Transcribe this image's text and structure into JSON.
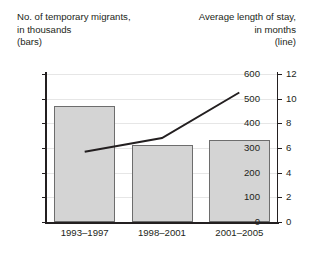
{
  "captions": {
    "left": "No. of temporary migrants,\nin thousands\n(bars)",
    "right": "Average length of stay,\nin months\n(line)"
  },
  "colors": {
    "bar_fill": "#d4d4d4",
    "bar_stroke": "#6d6d6d",
    "line": "#231f20",
    "axis": "#231f20",
    "grid": "#e6e6e6",
    "background": "#ffffff"
  },
  "chart_data": {
    "type": "bar",
    "title": "",
    "subtitle": "",
    "xlabel": "",
    "categories": [
      "1993–1997",
      "1998–2001",
      "2001–2005"
    ],
    "grid": true,
    "legend": "none",
    "series": [
      {
        "name": "No. of temporary migrants, in thousands (bars)",
        "type": "bar",
        "axis": "left",
        "values": [
          470,
          312,
          332
        ]
      },
      {
        "name": "Average length of stay, in months (line)",
        "type": "line",
        "axis": "right",
        "values": [
          5.7,
          6.8,
          10.5
        ]
      }
    ],
    "left_axis": {
      "label": "No. of temporary migrants, in thousands (bars)",
      "ylim": [
        0,
        600
      ],
      "ticks": [
        0,
        100,
        200,
        300,
        400,
        500,
        600
      ],
      "tick_labels": [
        "0",
        "100",
        "200",
        "300",
        "400",
        "500",
        "600"
      ]
    },
    "right_axis": {
      "label": "Average length of stay, in months (line)",
      "ylim": [
        0,
        12
      ],
      "ticks": [
        0,
        2,
        4,
        6,
        8,
        10,
        12
      ],
      "tick_labels": [
        "0",
        "2",
        "4",
        "6",
        "8",
        "10",
        "12"
      ]
    }
  }
}
